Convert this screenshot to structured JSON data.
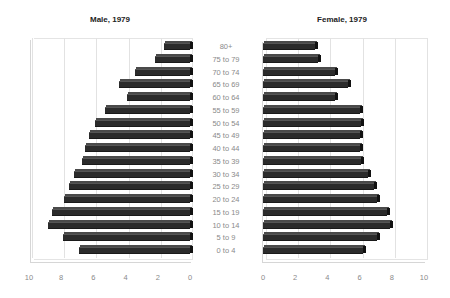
{
  "chart_data": [
    {
      "type": "bar",
      "orientation": "horizontal",
      "style": "3d",
      "title": "Male, 1979",
      "xlabel": "",
      "ylabel": "",
      "xlim": [
        10,
        0
      ],
      "x_reversed": true,
      "x_ticks": [
        "10",
        "8",
        "6",
        "4",
        "2",
        "0"
      ],
      "grid": true,
      "categories": [
        "80+",
        "75 to 79",
        "70 to 74",
        "65 to 69",
        "60 to 64",
        "55 to 59",
        "50 to 54",
        "45 to 49",
        "40 to 44",
        "35 to 39",
        "30 to 34",
        "25 to 29",
        "20 to 24",
        "15 to 19",
        "10 to 14",
        "5 to 9",
        "0 to 4"
      ],
      "values": [
        1.6,
        2.2,
        3.4,
        4.4,
        3.9,
        5.3,
        5.9,
        6.3,
        6.5,
        6.7,
        7.2,
        7.5,
        7.8,
        8.6,
        8.8,
        7.9,
        6.9
      ],
      "bar_color": "#2b2b2b"
    },
    {
      "type": "bar",
      "orientation": "horizontal",
      "style": "3d",
      "title": "Female, 1979",
      "xlabel": "",
      "ylabel": "",
      "xlim": [
        0,
        10
      ],
      "x_ticks": [
        "0",
        "2",
        "4",
        "6",
        "8",
        "10"
      ],
      "grid": true,
      "categories": [
        "80+",
        "75 to 79",
        "70 to 74",
        "65 to 69",
        "60 to 64",
        "55 to 59",
        "50 to 54",
        "45 to 49",
        "40 to 44",
        "35 to 39",
        "30 to 34",
        "25 to 29",
        "20 to 24",
        "15 to 19",
        "10 to 14",
        "5 to 9",
        "0 to 4"
      ],
      "values": [
        3.2,
        3.4,
        4.5,
        5.3,
        4.5,
        6.0,
        6.1,
        6.0,
        6.0,
        6.1,
        6.5,
        6.9,
        7.1,
        7.7,
        7.9,
        7.1,
        6.2
      ],
      "bar_color": "#2b2b2b"
    }
  ],
  "male": {
    "title": "Male, 1979",
    "ticks": [
      "10",
      "8",
      "6",
      "4",
      "2",
      "0"
    ]
  },
  "female": {
    "title": "Female, 1979",
    "ticks": [
      "0",
      "2",
      "4",
      "6",
      "8",
      "10"
    ]
  },
  "categories": [
    "80+",
    "75 to 79",
    "70 to 74",
    "65 to 69",
    "60 to 64",
    "55 to 59",
    "50 to 54",
    "45 to 49",
    "40 to 44",
    "35 to 39",
    "30 to 34",
    "25 to 29",
    "20 to 24",
    "15 to 19",
    "10 to 14",
    "5 to 9",
    "0 to 4"
  ]
}
